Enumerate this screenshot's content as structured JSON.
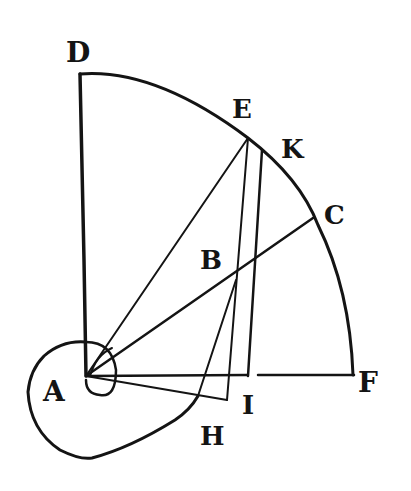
{
  "figure": {
    "labels": {
      "D": "D",
      "E": "E",
      "K": "K",
      "C": "C",
      "B": "B",
      "A": "A",
      "F": "F",
      "I": "I",
      "H": "H"
    },
    "points": {
      "A": [
        86,
        376
      ],
      "D": [
        79,
        74
      ],
      "E": [
        248,
        138
      ],
      "K": [
        262,
        150
      ],
      "C": [
        313,
        218
      ],
      "F": [
        354,
        375
      ],
      "B": [
        236,
        280
      ],
      "H": [
        227,
        400
      ],
      "I": [
        248,
        376
      ]
    },
    "colors": {
      "ink": "#141414",
      "paper": "#ffffff"
    }
  }
}
